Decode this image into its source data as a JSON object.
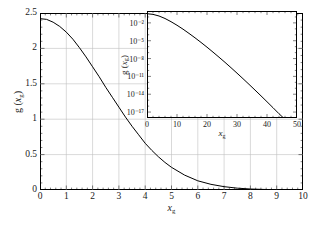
{
  "chart_data": {
    "type": "line",
    "title": "",
    "xlabel": "x_g",
    "ylabel": "g (x_g)",
    "xlim": [
      0,
      10
    ],
    "ylim": [
      0,
      2.5
    ],
    "grid": true,
    "legend": "none",
    "x_ticks": [
      0,
      1,
      2,
      3,
      4,
      5,
      6,
      7,
      8,
      9,
      10
    ],
    "x_tick_labels": [
      "0",
      "1",
      "2",
      "3",
      "4",
      "5",
      "6",
      "7",
      "8",
      "9",
      "10"
    ],
    "y_ticks": [
      0,
      0.5,
      1,
      1.5,
      2,
      2.5
    ],
    "y_tick_labels": [
      "0",
      "0.5",
      "1",
      "1.5",
      "2",
      "2.5"
    ],
    "series": [
      {
        "name": "g(x_g)",
        "color": "#000000",
        "x": [
          0,
          0.25,
          0.5,
          0.75,
          1,
          1.25,
          1.5,
          1.75,
          2,
          2.25,
          2.5,
          2.75,
          3,
          3.25,
          3.5,
          3.75,
          4,
          4.25,
          4.5,
          4.75,
          5,
          5.5,
          6,
          6.5,
          7,
          7.5,
          8,
          8.5,
          9,
          9.5,
          10
        ],
        "y": [
          2.42,
          2.41,
          2.37,
          2.31,
          2.23,
          2.13,
          2.01,
          1.88,
          1.74,
          1.6,
          1.45,
          1.31,
          1.17,
          1.03,
          0.9,
          0.78,
          0.66,
          0.56,
          0.47,
          0.39,
          0.32,
          0.21,
          0.13,
          0.08,
          0.047,
          0.026,
          0.014,
          0.008,
          0.004,
          0.002,
          0.001
        ]
      }
    ],
    "inset": {
      "type": "line",
      "xlabel": "x_g",
      "ylabel": "g (x_g)",
      "xlim": [
        0,
        50
      ],
      "ylim": [
        1e-18,
        1
      ],
      "yscale": "log",
      "grid": false,
      "x_ticks": [
        0,
        10,
        20,
        30,
        40,
        50
      ],
      "x_tick_labels": [
        "0",
        "10",
        "20",
        "30",
        "40",
        "50"
      ],
      "y_ticks": [
        0.01,
        1e-05,
        1e-08,
        1e-11,
        1e-14,
        1e-17
      ],
      "y_tick_labels": [
        "10⁻²",
        "10⁻⁵",
        "10⁻⁸",
        "10⁻¹¹",
        "10⁻¹⁴",
        "10⁻¹⁷"
      ],
      "series": [
        {
          "name": "g(x_g)",
          "color": "#000000",
          "x": [
            0,
            2,
            4,
            6,
            8,
            10,
            12,
            14,
            16,
            18,
            20,
            22,
            24,
            26,
            28,
            30,
            32,
            34,
            36,
            38,
            40,
            42,
            44,
            46,
            48,
            49
          ],
          "y": [
            0.35,
            0.27,
            0.145,
            0.055,
            0.016,
            0.004,
            0.00088,
            0.00017,
            3.1e-05,
            5.2e-06,
            8.2e-07,
            1.2e-07,
            1.7e-08,
            2.3e-09,
            2.9e-10,
            3.5e-11,
            4.1e-12,
            4.6e-13,
            5e-14,
            5.3e-15,
            5.4e-16,
            5.4e-17,
            5.2e-18,
            6e-19,
            8e-20,
            3e-20
          ]
        }
      ]
    }
  },
  "main_axis": {
    "ylabel_prefix": "g (",
    "ylabel_var": "x",
    "ylabel_sub": "g",
    "ylabel_suffix": ")",
    "xlabel_var": "x",
    "xlabel_sub": "g"
  },
  "inset_axis": {
    "ylabel_prefix": "g (",
    "ylabel_var": "x",
    "ylabel_sub": "g",
    "ylabel_suffix": ")",
    "xlabel_var": "x",
    "xlabel_sub": "g"
  },
  "style": {
    "curve_color": "#000000",
    "grid_color": "#bfbfbf",
    "frame_color": "#000000",
    "background": "#ffffff"
  }
}
